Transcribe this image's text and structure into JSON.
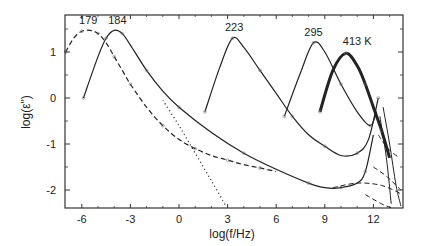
{
  "chart_data": {
    "type": "line",
    "title": "",
    "xlabel": "log(f/Hz)",
    "ylabel": "log(ε\")",
    "xlim": [
      -7,
      14
    ],
    "ylim": [
      -2.4,
      1.8
    ],
    "x_ticks": [
      -6,
      -3,
      0,
      3,
      6,
      9,
      12
    ],
    "x_tick_labels": [
      "-6",
      "-3",
      "0",
      "3",
      "6",
      "9",
      "12"
    ],
    "y_ticks": [
      -2,
      -1,
      0,
      1
    ],
    "y_tick_labels": [
      "-2",
      "-1",
      "0",
      "1"
    ],
    "grid": false,
    "legend": null,
    "annotations": [
      {
        "text": "179",
        "x": -5.6,
        "y": 1.6
      },
      {
        "text": "184",
        "x": -3.8,
        "y": 1.6
      },
      {
        "text": "223",
        "x": 3.4,
        "y": 1.45
      },
      {
        "text": "295",
        "x": 8.3,
        "y": 1.35
      },
      {
        "text": "413 K",
        "x": 11.0,
        "y": 1.15
      }
    ],
    "series": [
      {
        "name": "179",
        "style": "dashed",
        "x": [
          -7,
          -6.5,
          -6,
          -5.5,
          -5,
          -4.5,
          -4,
          -3.5,
          -3,
          -2,
          -1,
          0,
          1,
          2,
          3,
          4,
          5,
          6
        ],
        "y": [
          1.0,
          1.3,
          1.45,
          1.47,
          1.4,
          1.2,
          0.9,
          0.6,
          0.3,
          -0.2,
          -0.6,
          -0.9,
          -1.1,
          -1.25,
          -1.35,
          -1.45,
          -1.52,
          -1.6
        ]
      },
      {
        "name": "184",
        "style": "solid",
        "x": [
          -5.9,
          -5,
          -4.5,
          -4,
          -3.5,
          -3,
          -2,
          -1,
          0,
          2,
          4,
          6,
          8,
          9,
          10,
          11,
          11.5,
          12
        ],
        "y": [
          0.0,
          0.9,
          1.3,
          1.47,
          1.4,
          1.15,
          0.6,
          0.15,
          -0.2,
          -0.75,
          -1.2,
          -1.55,
          -1.85,
          -1.95,
          -1.95,
          -1.85,
          -1.6,
          -0.8
        ]
      },
      {
        "name": "223",
        "style": "solid",
        "x": [
          1.6,
          2.5,
          3.3,
          4,
          5,
          6,
          7,
          8,
          9,
          10,
          11,
          11.7,
          12.3
        ],
        "y": [
          -0.3,
          0.65,
          1.3,
          1.1,
          0.6,
          0.1,
          -0.4,
          -0.8,
          -1.05,
          -1.25,
          -1.2,
          -0.9,
          0.0
        ]
      },
      {
        "name": "295",
        "style": "solid",
        "x": [
          6.5,
          7.5,
          8.3,
          9,
          10,
          11,
          11.8,
          12.2
        ],
        "y": [
          -0.4,
          0.55,
          1.2,
          1.0,
          0.3,
          -0.3,
          -0.6,
          -0.3
        ]
      },
      {
        "name": "413 K",
        "style": "solid-thick",
        "x": [
          8.7,
          9.5,
          10.3,
          11,
          11.5,
          12,
          12.5,
          13
        ],
        "y": [
          -0.3,
          0.6,
          0.97,
          0.7,
          0.3,
          -0.2,
          -0.7,
          -1.3
        ]
      },
      {
        "name": "dotted",
        "style": "dotted",
        "x": [
          -1,
          0,
          1,
          2,
          2.9
        ],
        "y": [
          -0.05,
          -0.6,
          -1.2,
          -1.8,
          -2.35
        ]
      }
    ]
  }
}
